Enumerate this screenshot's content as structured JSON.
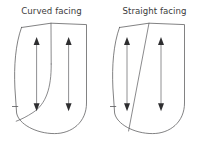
{
  "figure": {
    "background_color": "#ffffff",
    "line_color": "#58585a",
    "arrow_color": "#2e2e30",
    "text_color": "#3b3b3b",
    "width": 206,
    "height": 150
  },
  "panels": [
    {
      "id": "curved",
      "label": "Curved facing",
      "facing_line_style": "curved",
      "notch": {
        "edge": "left",
        "label": "notch-tick"
      },
      "grainlines": [
        {
          "id": "grainline-left",
          "label": "grainline-arrow",
          "direction": "double-headed"
        },
        {
          "id": "grainline-right",
          "label": "grainline-arrow",
          "direction": "double-headed"
        }
      ]
    },
    {
      "id": "straight",
      "label": "Straight facing",
      "facing_line_style": "straight",
      "notch": {
        "edge": "left",
        "label": "notch-tick"
      },
      "grainlines": [
        {
          "id": "grainline-left",
          "label": "grainline-arrow",
          "direction": "double-headed"
        },
        {
          "id": "grainline-right",
          "label": "grainline-arrow",
          "direction": "double-headed"
        }
      ]
    }
  ]
}
